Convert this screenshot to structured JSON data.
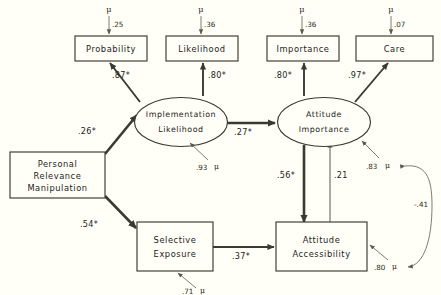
{
  "diagram": {
    "background_color": "#fffff7",
    "line_color": "#3a3a30",
    "observed_indicators": [
      {
        "id": "probability",
        "label": "Probability",
        "error_symbol": "μ",
        "error_value": ".25"
      },
      {
        "id": "likelihood",
        "label": "Likelihood",
        "error_symbol": "μ",
        "error_value": ".36"
      },
      {
        "id": "importance",
        "label": "Importance",
        "error_symbol": "μ",
        "error_value": ".36"
      },
      {
        "id": "care",
        "label": "Care",
        "error_symbol": "μ",
        "error_value": ".07"
      }
    ],
    "latent_factors": [
      {
        "id": "implementation-likelihood",
        "label_line1": "Implementation",
        "label_line2": "Likelihood",
        "disturbance_value": ".93",
        "disturbance_symbol": "μ"
      },
      {
        "id": "attitude-importance",
        "label_line1": "Attitude",
        "label_line2": "Importance",
        "disturbance_value": ".83",
        "disturbance_symbol": "μ"
      }
    ],
    "manifest_variables": [
      {
        "id": "personal-relevance-manipulation",
        "label_line1": "Personal",
        "label_line2": "Relevance",
        "label_line3": "Manipulation"
      },
      {
        "id": "selective-exposure",
        "label_line1": "Selective",
        "label_line2": "Exposure",
        "disturbance_value": ".71",
        "disturbance_symbol": "μ"
      },
      {
        "id": "attitude-accessibility",
        "label_line1": "Attitude",
        "label_line2": "Accessibility",
        "disturbance_value": ".80",
        "disturbance_symbol": "μ"
      }
    ],
    "paths": [
      {
        "id": "impl-to-probability",
        "from": "implementation-likelihood",
        "to": "probability",
        "coefficient": ".87*",
        "kind": "loading"
      },
      {
        "id": "impl-to-likelihood",
        "from": "implementation-likelihood",
        "to": "likelihood",
        "coefficient": ".80*",
        "kind": "loading"
      },
      {
        "id": "attimp-to-importance",
        "from": "attitude-importance",
        "to": "importance",
        "coefficient": ".80*",
        "kind": "loading"
      },
      {
        "id": "attimp-to-care",
        "from": "attitude-importance",
        "to": "care",
        "coefficient": ".97*",
        "kind": "loading"
      },
      {
        "id": "prm-to-impl",
        "from": "personal-relevance-manipulation",
        "to": "implementation-likelihood",
        "coefficient": ".26*",
        "kind": "structural"
      },
      {
        "id": "prm-to-selexp",
        "from": "personal-relevance-manipulation",
        "to": "selective-exposure",
        "coefficient": ".54*",
        "kind": "structural"
      },
      {
        "id": "impl-to-attimp",
        "from": "implementation-likelihood",
        "to": "attitude-importance",
        "coefficient": ".27*",
        "kind": "structural"
      },
      {
        "id": "attimp-to-attacc",
        "from": "attitude-importance",
        "to": "attitude-accessibility",
        "coefficient": ".56*",
        "kind": "structural"
      },
      {
        "id": "attacc-to-attimp",
        "from": "attitude-accessibility",
        "to": "attitude-importance",
        "coefficient": ".21",
        "kind": "structural"
      },
      {
        "id": "selexp-to-attacc",
        "from": "selective-exposure",
        "to": "attitude-accessibility",
        "coefficient": ".37*",
        "kind": "structural"
      },
      {
        "id": "disturbance-correlation",
        "from": "attitude-importance-disturbance",
        "to": "attitude-accessibility-disturbance",
        "coefficient": "-.41",
        "kind": "correlation"
      }
    ]
  }
}
